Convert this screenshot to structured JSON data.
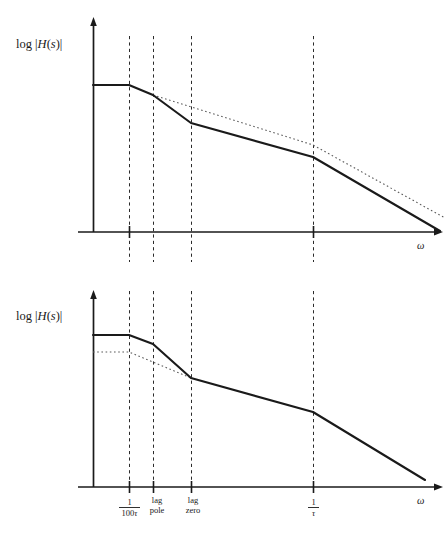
{
  "figure": {
    "background_color": "#ffffff",
    "ink_color": "#1a1a1a",
    "dash_color": "#2b2b2b",
    "dotted_color": "#5a5a5a"
  },
  "plots": [
    {
      "id": "top-plot",
      "y_axis_label": "log |H(s)|",
      "x_axis_label": "ω",
      "ticks": [
        {
          "name": "one-over-100-tau",
          "label_numerator": "1",
          "label_denominator": "100τ",
          "show_tick_mark": true
        },
        {
          "name": "one-over-tau",
          "label_numerator": "1",
          "label_denominator": "τ",
          "show_tick_mark": true
        }
      ],
      "gridlines": [
        {
          "name": "gridline-one-over-100-tau"
        },
        {
          "name": "gridline-lag-pole"
        },
        {
          "name": "gridline-lag-zero"
        },
        {
          "name": "gridline-one-over-tau"
        }
      ]
    },
    {
      "id": "bottom-plot",
      "y_axis_label": "log |H(s)|",
      "x_axis_label": "ω",
      "ticks": [
        {
          "name": "one-over-100-tau",
          "label_numerator": "1",
          "label_denominator": "100τ",
          "show_tick_mark": true
        },
        {
          "name": "lag-pole",
          "label_line1": "lag",
          "label_line2": "pole",
          "show_tick_mark": true
        },
        {
          "name": "lag-zero",
          "label_line1": "lag",
          "label_line2": "zero",
          "show_tick_mark": true
        },
        {
          "name": "one-over-tau",
          "label_numerator": "1",
          "label_denominator": "τ",
          "show_tick_mark": true
        }
      ],
      "gridlines": [
        {
          "name": "gridline-one-over-100-tau"
        },
        {
          "name": "gridline-lag-pole"
        },
        {
          "name": "gridline-lag-zero"
        },
        {
          "name": "gridline-one-over-tau"
        }
      ]
    }
  ],
  "chart_data": [
    {
      "type": "line",
      "id": "top-plot",
      "title": "",
      "xlabel": "ω",
      "ylabel": "log |H(s)|",
      "xlim": [
        93,
        445
      ],
      "ylim": [
        232,
        20
      ],
      "grid": true,
      "legend": "none",
      "x_tick_positions": [
        129,
        153,
        191,
        313
      ],
      "x_tick_labels": [
        "1/100τ",
        "lag pole",
        "lag zero",
        "1/τ"
      ],
      "x_tick_labels_shown": [
        "1/100τ",
        "",
        "",
        "1/τ"
      ],
      "gridline_x": [
        129,
        153,
        191,
        313
      ],
      "axis_origin_x": 93,
      "axis_baseline_y": 232,
      "series": [
        {
          "name": "uncompensated-asymptote",
          "style": "solid",
          "points": [
            [
              93,
              85
            ],
            [
              129,
              85
            ],
            [
              153,
              95
            ],
            [
              191,
              123
            ],
            [
              313,
              157
            ],
            [
              440,
              231
            ]
          ]
        },
        {
          "name": "compensated-reference-asymptote",
          "style": "dotted",
          "points": [
            [
              153,
              95
            ],
            [
              313,
              145
            ],
            [
              445,
              218
            ]
          ]
        }
      ]
    },
    {
      "type": "line",
      "id": "bottom-plot",
      "title": "",
      "xlabel": "ω",
      "ylabel": "log |H(s)|",
      "xlim": [
        93,
        445
      ],
      "ylim": [
        487,
        290
      ],
      "grid": true,
      "legend": "none",
      "x_tick_positions": [
        129,
        153,
        191,
        313
      ],
      "x_tick_labels": [
        "1/100τ",
        "lag pole",
        "lag zero",
        "1/τ"
      ],
      "x_tick_labels_shown": [
        "1/100τ",
        "lag pole",
        "lag zero",
        "1/τ"
      ],
      "gridline_x": [
        129,
        153,
        191,
        313
      ],
      "axis_origin_x": 93,
      "axis_baseline_y": 487,
      "series": [
        {
          "name": "uncompensated-asymptote",
          "style": "solid",
          "points": [
            [
              93,
              335
            ],
            [
              129,
              335
            ],
            [
              153,
              344
            ],
            [
              191,
              378
            ],
            [
              313,
              412
            ],
            [
              425,
              480
            ]
          ]
        },
        {
          "name": "lag-compensated-reference",
          "style": "dotted",
          "points": [
            [
              93,
              352
            ],
            [
              129,
              352
            ],
            [
              191,
              378
            ]
          ]
        }
      ]
    }
  ]
}
